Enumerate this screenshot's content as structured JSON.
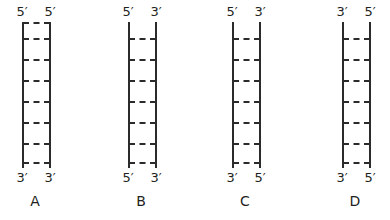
{
  "figure": {
    "type": "dna-duplex-polarity-diagram",
    "panel_count": 4,
    "rung_count": 7,
    "line_color": "#2b2b2b",
    "text_color": "#231f20",
    "background_color": "#ffffff"
  },
  "panels": [
    {
      "caption": "A",
      "top_left_end": "5′",
      "top_right_end": "5′",
      "bottom_left_end": "3′",
      "bottom_right_end": "3′"
    },
    {
      "caption": "B",
      "top_left_end": "5′",
      "top_right_end": "3′",
      "bottom_left_end": "5′",
      "bottom_right_end": "3′"
    },
    {
      "caption": "C",
      "top_left_end": "5′",
      "top_right_end": "3′",
      "bottom_left_end": "3′",
      "bottom_right_end": "5′"
    },
    {
      "caption": "D",
      "top_left_end": "3′",
      "top_right_end": "5′",
      "bottom_left_end": "3′",
      "bottom_right_end": "5′"
    }
  ]
}
